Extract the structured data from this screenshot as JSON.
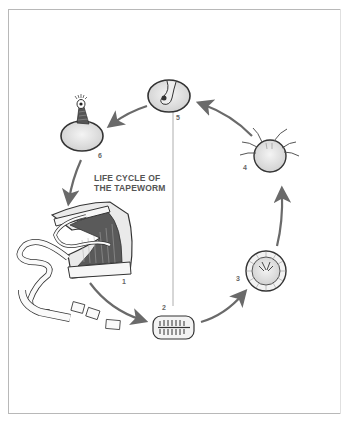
{
  "title": {
    "line1": "LIFE CYCLE OF",
    "line2": "THE TAPEWORM"
  },
  "stages": [
    {
      "id": "1",
      "label": "1",
      "name": "adult tapeworm in intestine"
    },
    {
      "id": "2",
      "label": "2",
      "name": "proglottid with eggs"
    },
    {
      "id": "3",
      "label": "3",
      "name": "egg"
    },
    {
      "id": "4",
      "label": "4",
      "name": "hooked embryo"
    },
    {
      "id": "5",
      "label": "5",
      "name": "cysticercus"
    },
    {
      "id": "6",
      "label": "6",
      "name": "evaginated scolex"
    }
  ],
  "colors": {
    "arrow": "#6a6a6a",
    "frame": "#b8b8b8",
    "ink": "#333333",
    "stipple": "#d8d8d8",
    "label": "#666666"
  }
}
